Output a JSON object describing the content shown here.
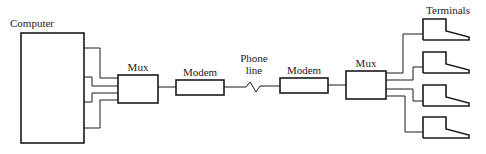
{
  "diagram": {
    "type": "network-block-diagram",
    "labels": {
      "computer": "Computer",
      "mux_left": "Mux",
      "modem_left": "Modem",
      "phone_line_1": "Phone",
      "phone_line_2": "line",
      "modem_right": "Modem",
      "mux_right": "Mux",
      "terminals": "Terminals"
    },
    "nodes": [
      {
        "id": "computer",
        "label": "Computer"
      },
      {
        "id": "mux_left",
        "label": "Mux"
      },
      {
        "id": "modem_left",
        "label": "Modem"
      },
      {
        "id": "phone_line",
        "label": "Phone line"
      },
      {
        "id": "modem_right",
        "label": "Modem"
      },
      {
        "id": "mux_right",
        "label": "Mux"
      },
      {
        "id": "terminal_1",
        "label": ""
      },
      {
        "id": "terminal_2",
        "label": ""
      },
      {
        "id": "terminal_3",
        "label": ""
      },
      {
        "id": "terminal_4",
        "label": ""
      }
    ],
    "edges": [
      {
        "from": "computer",
        "to": "mux_left",
        "count": 4
      },
      {
        "from": "mux_left",
        "to": "modem_left"
      },
      {
        "from": "modem_left",
        "to": "phone_line"
      },
      {
        "from": "phone_line",
        "to": "modem_right"
      },
      {
        "from": "modem_right",
        "to": "mux_right"
      },
      {
        "from": "mux_right",
        "to": "terminal_1"
      },
      {
        "from": "mux_right",
        "to": "terminal_2"
      },
      {
        "from": "mux_right",
        "to": "terminal_3"
      },
      {
        "from": "mux_right",
        "to": "terminal_4"
      }
    ],
    "colors": {
      "stroke": "#1a1a1a",
      "background": "#ffffff"
    }
  }
}
